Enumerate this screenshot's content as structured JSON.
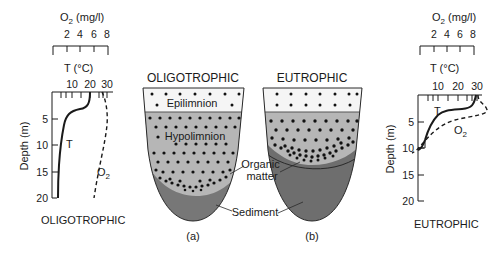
{
  "left_profile": {
    "o2_axis_label": "O",
    "o2_axis_sub": "2",
    "o2_axis_unit": " (mg/l)",
    "o2_ticks": [
      "2",
      "4",
      "6",
      "8"
    ],
    "t_axis_label": "T (°C)",
    "t_ticks": [
      "10",
      "20",
      "30"
    ],
    "depth_label": "Depth (m)",
    "depth_ticks": [
      "5",
      "10",
      "15",
      "20"
    ],
    "t_curve_label": "T",
    "o2_curve_label": "O",
    "o2_curve_sub": "2",
    "caption": "OLIGOTROPHIC"
  },
  "right_profile": {
    "o2_axis_label": "O",
    "o2_axis_sub": "2",
    "o2_axis_unit": " (mg/l)",
    "o2_ticks": [
      "2",
      "4",
      "6",
      "8"
    ],
    "t_axis_label": "T (°C)",
    "t_ticks": [
      "10",
      "20",
      "30"
    ],
    "depth_label": "Depth (m)",
    "depth_ticks": [
      "5",
      "10",
      "15",
      "20"
    ],
    "t_curve_label": "T",
    "o2_curve_label": "O",
    "o2_curve_sub": "2",
    "caption": "EUTROPHIC"
  },
  "basin_a": {
    "title": "OLIGOTROPHIC",
    "epilimnion_label": "Epilimnion",
    "hypolimnion_label": "Hypolimnion",
    "caption": "(a)"
  },
  "basin_b": {
    "title": "EUTROPHIC",
    "caption": "(b)"
  },
  "callouts": {
    "organic_matter_line1": "Organic",
    "organic_matter_line2": "matter",
    "sediment": "Sediment"
  },
  "colors": {
    "epilimnion": "#f4f4f4",
    "hypolimnion": "#b4b4b4",
    "sediment": "#737373",
    "sediment_dark": "#6a6a6a",
    "line": "#1a1a1a"
  }
}
